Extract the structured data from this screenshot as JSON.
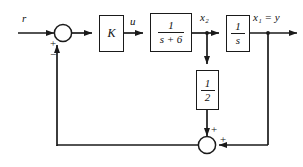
{
  "diagram": {
    "background_color": "#ffffff",
    "line_color": "#1a1a1a",
    "text_color": "#111111",
    "signals": {
      "input": "r",
      "controller_output": "u",
      "state_2": "x₂",
      "output": "x₁ = y"
    },
    "blocks": [
      {
        "id": "gain-k",
        "label": "K",
        "kind": "gain"
      },
      {
        "id": "first-order-lag",
        "numerator": "1",
        "denominator": "s + 6",
        "kind": "transfer-function"
      },
      {
        "id": "integrator",
        "numerator": "1",
        "denominator": "s",
        "kind": "transfer-function"
      },
      {
        "id": "feedback-gain-half",
        "numerator": "1",
        "denominator": "2",
        "kind": "gain"
      }
    ],
    "summers": {
      "input_summer": {
        "id": "input-summing-junction",
        "reference_sign": "+",
        "feedback_sign": "−"
      },
      "feedback_summer": {
        "id": "feedback-summing-junction",
        "vertical_sign": "+",
        "horizontal_sign": "+"
      }
    }
  }
}
